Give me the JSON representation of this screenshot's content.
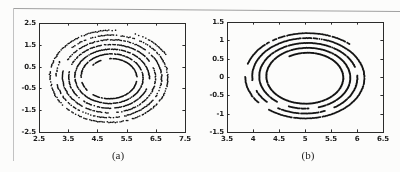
{
  "page": {
    "background": "#fcfcfb",
    "border_top_color": "#a0a0a0",
    "border_left_color": "#c2c2c2",
    "axis_color": "#2b2b2b",
    "tick_label_color": "#1b1b1b"
  },
  "chart_data": [
    {
      "type": "scatter",
      "caption": "(a)",
      "title": "",
      "xlabel": "",
      "ylabel": "",
      "xlim": [
        2.5,
        7.5
      ],
      "ylim": [
        -2.5,
        2.5
      ],
      "xticks": [
        2.5,
        3.5,
        4.5,
        5.5,
        6.5,
        7.5
      ],
      "xtick_labels": [
        "2.5",
        "3.5",
        "4.5",
        "5.5",
        "6.5",
        "7.5"
      ],
      "yticks": [
        2.5,
        1.5,
        0.5,
        -0.5,
        -1.5,
        -2.5
      ],
      "ytick_labels": [
        "2.5",
        "1.5",
        "0.5",
        "-0.5",
        "-1.5",
        "-2.5"
      ],
      "grid": false,
      "legend": null,
      "axis_color": "#2b2b2b",
      "series": [
        {
          "name": "quasi-periodic-orbit",
          "kind": "spiral-dots",
          "cx": 4.95,
          "cy": 0.0,
          "r_outer": 2.16,
          "r_inner": 0.82,
          "turns": 6.3,
          "end_angle_deg": 137,
          "aspect_y": 1.02,
          "points_per_turn": 230,
          "dot_radius_px": 0.8,
          "jitter_inner": 0.01,
          "jitter_outer": 0.035,
          "skip_prob": 0.2,
          "gap_prob": 0.012,
          "color": "#121212",
          "seed": 12
        }
      ]
    },
    {
      "type": "scatter",
      "caption": "(b)",
      "title": "",
      "xlabel": "",
      "ylabel": "",
      "xlim": [
        3.5,
        6.5
      ],
      "ylim": [
        -1.5,
        1.5
      ],
      "xticks": [
        3.5,
        4,
        4.5,
        5,
        5.5,
        6,
        6.5
      ],
      "xtick_labels": [
        "3.5",
        "4",
        "4.5",
        "5",
        "5.5",
        "6",
        "6.5"
      ],
      "yticks": [
        1.5,
        1,
        0.5,
        0,
        -0.5,
        -1,
        -1.5
      ],
      "ytick_labels": [
        "1.5",
        "1",
        "0.5",
        "0",
        "-0.5",
        "-1",
        "-1.5"
      ],
      "grid": false,
      "legend": null,
      "axis_color": "#2b2b2b",
      "series": [
        {
          "name": "quasi-periodic-orbit",
          "kind": "spiral-dots",
          "cx": 5.03,
          "cy": 0.0,
          "r_outer": 1.23,
          "r_inner": 0.66,
          "turns": 4.2,
          "end_angle_deg": 120,
          "aspect_y": 0.985,
          "points_per_turn": 300,
          "dot_radius_px": 0.95,
          "jitter_inner": 0.004,
          "jitter_outer": 0.008,
          "skip_prob": 0.05,
          "gap_prob": 0.006,
          "color": "#141414",
          "seed": 5
        }
      ]
    }
  ]
}
